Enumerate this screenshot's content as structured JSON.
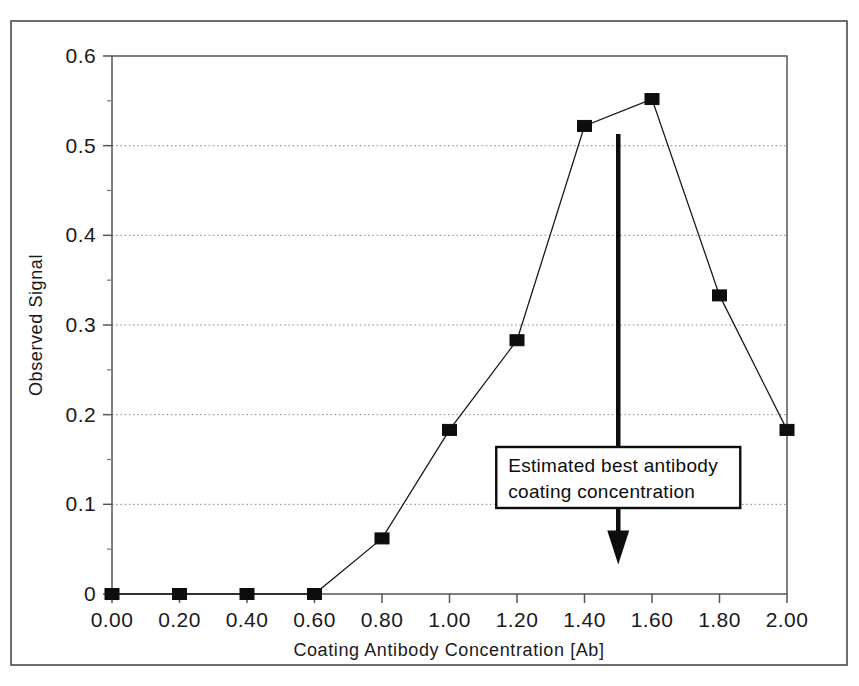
{
  "figure": {
    "frame_color": "#4a4a4a",
    "background": "#ffffff",
    "marker_color": "#0d0d0d",
    "line_color": "#1a1a1a",
    "grid_color": "#8a8a8a"
  },
  "chart_data": {
    "type": "line",
    "title": "",
    "xlabel": "Coating Antibody Concentration [Ab]",
    "ylabel": "Observed Signal",
    "xlim": [
      0.0,
      2.0
    ],
    "ylim": [
      0.0,
      0.6
    ],
    "grid": "horizontal-dotted",
    "legend": "none",
    "x": [
      0.0,
      0.2,
      0.4,
      0.6,
      0.8,
      1.0,
      1.2,
      1.4,
      1.6,
      1.8,
      2.0
    ],
    "values": [
      0.0,
      0.0,
      0.0,
      0.0,
      0.062,
      0.183,
      0.283,
      0.522,
      0.552,
      0.333,
      0.183
    ],
    "series": [
      {
        "name": "Observed Signal",
        "marker": "filled-square",
        "values": [
          0.0,
          0.0,
          0.0,
          0.0,
          0.062,
          0.183,
          0.283,
          0.522,
          0.552,
          0.333,
          0.183
        ]
      }
    ],
    "xticks": [
      0.0,
      0.2,
      0.4,
      0.6,
      0.8,
      1.0,
      1.2,
      1.4,
      1.6,
      1.8,
      2.0
    ],
    "xtick_labels": [
      "0.00",
      "0.20",
      "0.40",
      "0.60",
      "0.80",
      "1.00",
      "1.20",
      "1.40",
      "1.60",
      "1.80",
      "2.00"
    ],
    "yticks": [
      0.0,
      0.1,
      0.2,
      0.3,
      0.4,
      0.5,
      0.6
    ],
    "ytick_labels": [
      "0",
      "0.1",
      "0.2",
      "0.3",
      "0.4",
      "0.5",
      "0.6"
    ],
    "annotations": [
      {
        "kind": "boxed-label-with-arrow",
        "line1": "Estimated best antibody",
        "line2": "coating concentration",
        "x": 1.5,
        "arrow_from_y": 0.513,
        "arrow_to_y": 0.033,
        "arrow_direction": "down"
      }
    ]
  }
}
